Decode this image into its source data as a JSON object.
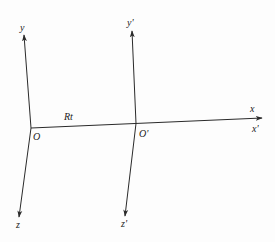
{
  "diagram": {
    "frames": [
      {
        "origin_label": "O",
        "origin": [
          31,
          128
        ],
        "axes": {
          "x": {
            "label": "x",
            "tip": [
              262,
              118
            ]
          },
          "y": {
            "label": "y",
            "tip": [
              24,
              35
            ]
          },
          "z": {
            "label": "z",
            "tip": [
              19,
              217
            ]
          }
        }
      },
      {
        "origin_label": "O'",
        "origin": [
          136,
          123.5
        ],
        "axes": {
          "x": {
            "label": "x'",
            "tip": [
              262,
              118
            ]
          },
          "y": {
            "label": "y'",
            "tip": [
              132,
              31
            ]
          },
          "z": {
            "label": "z'",
            "tip": [
              125,
              216
            ]
          }
        }
      }
    ],
    "displacement_label": "Rt",
    "colors": {
      "line": "#2a2a2a",
      "text": "#222222",
      "background": "#fdfdfd"
    }
  },
  "labels": {
    "y": "y",
    "y_prime": "y'",
    "x": "x",
    "x_prime": "x'",
    "z": "z",
    "z_prime": "z'",
    "O": "O",
    "O_prime": "O'",
    "Rt": "Rt"
  }
}
